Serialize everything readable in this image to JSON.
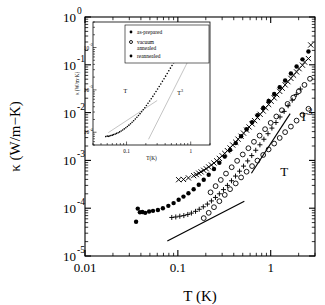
{
  "chart_data": {
    "type": "scatter",
    "title": "",
    "xlabel": "T  (K)",
    "ylabel": "κ  (W/m−K)",
    "xscale": "log",
    "yscale": "log",
    "xlim": [
      0.01,
      3.0
    ],
    "ylim": [
      1e-05,
      1.0
    ],
    "xticks": [
      0.01,
      0.1,
      1
    ],
    "xtick_labels": [
      "0.01",
      "0.1",
      "1"
    ],
    "yticks": [
      1.0,
      0.1,
      0.01,
      0.001,
      0.0001,
      1e-05
    ],
    "ytick_labels": [
      "10",
      "10",
      "10",
      "10",
      "10",
      "10"
    ],
    "ytick_exponents": [
      "0",
      "-1",
      "-2",
      "-3",
      "-4",
      "-5"
    ],
    "grid": false,
    "legend_position": "inset-top-left",
    "annotations": [
      {
        "text": "T",
        "x": 1.27,
        "y": 0.00048
      },
      {
        "text": "T",
        "sup": "3",
        "x": 2.05,
        "y": 0.0068
      }
    ],
    "guide_lines": [
      {
        "label": "T",
        "slope": 1,
        "x0": 0.077,
        "y0": 2.05e-05,
        "x1": 0.52,
        "y1": 0.00014
      },
      {
        "label": "T3",
        "slope": 3,
        "x0": 0.62,
        "y0": 0.00054,
        "x1": 1.62,
        "y1": 0.0095
      }
    ],
    "series": [
      {
        "name": "as-prepared",
        "marker": "filled-circle",
        "points": [
          [
            0.0355,
            5.2e-05
          ],
          [
            0.037,
            9.8e-05
          ],
          [
            0.039,
            8.2e-05
          ],
          [
            0.0415,
            8.3e-05
          ],
          [
            0.0445,
            8e-05
          ],
          [
            0.049,
            8.5e-05
          ],
          [
            0.054,
            8.8e-05
          ],
          [
            0.061,
            9.2e-05
          ],
          [
            0.069,
            0.0001
          ],
          [
            0.079,
            0.000112
          ],
          [
            0.09,
            0.000128
          ],
          [
            0.102,
            0.00015
          ],
          [
            0.115,
            0.000175
          ],
          [
            0.13,
            0.000205
          ],
          [
            0.148,
            0.00025
          ],
          [
            0.168,
            0.00031
          ],
          [
            0.19,
            0.000395
          ],
          [
            0.215,
            0.0005
          ],
          [
            0.245,
            0.00066
          ],
          [
            0.28,
            0.00089
          ],
          [
            0.32,
            0.0012
          ],
          [
            0.365,
            0.00165
          ],
          [
            0.42,
            0.0023
          ],
          [
            0.48,
            0.0032
          ],
          [
            0.55,
            0.0045
          ],
          [
            0.63,
            0.0063
          ],
          [
            0.72,
            0.0088
          ],
          [
            0.83,
            0.0125
          ],
          [
            0.95,
            0.0175
          ],
          [
            1.09,
            0.0245
          ],
          [
            1.25,
            0.034
          ],
          [
            1.43,
            0.047
          ],
          [
            1.65,
            0.066
          ],
          [
            1.9,
            0.092
          ],
          [
            2.2,
            0.13
          ],
          [
            2.55,
            0.19
          ]
        ]
      },
      {
        "name": "vacuum annealed",
        "marker": "open-circle",
        "points": [
          [
            0.19,
            6.2e-05
          ],
          [
            0.215,
            8e-05
          ],
          [
            0.245,
            0.000105
          ],
          [
            0.28,
            0.00014
          ],
          [
            0.32,
            0.00019
          ],
          [
            0.365,
            0.00025
          ],
          [
            0.42,
            0.00033
          ],
          [
            0.48,
            0.00044
          ],
          [
            0.55,
            0.00058
          ],
          [
            0.63,
            0.00076
          ],
          [
            0.72,
            0.00099
          ],
          [
            0.83,
            0.0013
          ],
          [
            0.95,
            0.0017
          ],
          [
            1.09,
            0.00225
          ],
          [
            1.25,
            0.00295
          ],
          [
            1.43,
            0.0039
          ],
          [
            1.65,
            0.0051
          ],
          [
            1.9,
            0.0068
          ],
          [
            2.2,
            0.009
          ],
          [
            2.55,
            0.012
          ],
          [
            0.225,
            0.000215
          ],
          [
            0.255,
            0.00029
          ],
          [
            0.29,
            0.00039
          ],
          [
            0.33,
            0.00053
          ],
          [
            0.38,
            0.00072
          ],
          [
            0.435,
            0.00098
          ],
          [
            0.5,
            0.00133
          ],
          [
            0.575,
            0.0018
          ],
          [
            0.66,
            0.00245
          ],
          [
            0.76,
            0.0033
          ],
          [
            0.87,
            0.0045
          ],
          [
            1.0,
            0.0061
          ],
          [
            1.15,
            0.0083
          ],
          [
            1.32,
            0.0112
          ],
          [
            1.52,
            0.0152
          ],
          [
            1.75,
            0.0206
          ],
          [
            2.01,
            0.028
          ],
          [
            2.31,
            0.038
          ],
          [
            2.65,
            0.051
          ]
        ]
      },
      {
        "name": "reannealed",
        "marker": "cross",
        "points": [
          [
            0.13,
            0.00043
          ],
          [
            0.148,
            0.00048
          ],
          [
            0.168,
            0.00054
          ],
          [
            0.19,
            0.00062
          ],
          [
            0.215,
            0.00073
          ],
          [
            0.245,
            0.00088
          ],
          [
            0.28,
            0.0011
          ],
          [
            0.32,
            0.0014
          ],
          [
            0.365,
            0.00182
          ],
          [
            0.42,
            0.0024
          ],
          [
            0.48,
            0.0032
          ],
          [
            0.55,
            0.0043
          ],
          [
            0.63,
            0.0058
          ],
          [
            0.72,
            0.0079
          ],
          [
            0.83,
            0.0108
          ],
          [
            0.95,
            0.0148
          ],
          [
            1.09,
            0.0203
          ],
          [
            1.25,
            0.0278
          ],
          [
            1.43,
            0.038
          ],
          [
            1.65,
            0.052
          ],
          [
            1.9,
            0.071
          ],
          [
            2.2,
            0.098
          ],
          [
            2.55,
            0.135
          ],
          [
            2.7,
            0.26
          ],
          [
            0.115,
            0.0004
          ],
          [
            0.102,
            0.000395
          ],
          [
            0.158,
            0.000505
          ],
          [
            0.178,
            0.000575
          ],
          [
            0.202,
            0.00067
          ],
          [
            0.23,
            0.0008
          ],
          [
            0.262,
            0.00098
          ],
          [
            0.3,
            0.00125
          ],
          [
            0.342,
            0.0016
          ],
          [
            0.39,
            0.0021
          ],
          [
            0.445,
            0.00278
          ],
          [
            0.51,
            0.00372
          ],
          [
            0.585,
            0.005
          ],
          [
            0.67,
            0.0068
          ],
          [
            0.77,
            0.0092
          ],
          [
            0.88,
            0.0126
          ],
          [
            1.01,
            0.0173
          ],
          [
            1.16,
            0.0237
          ],
          [
            1.33,
            0.0324
          ],
          [
            1.53,
            0.0444
          ],
          [
            1.76,
            0.0607
          ],
          [
            2.02,
            0.083
          ],
          [
            2.32,
            0.114
          ]
        ]
      },
      {
        "name": "fourth-set",
        "marker": "plus",
        "points": [
          [
            0.086,
            6.4e-05
          ],
          [
            0.095,
            6.55e-05
          ],
          [
            0.105,
            6.8e-05
          ],
          [
            0.116,
            7e-05
          ],
          [
            0.128,
            7.4e-05
          ],
          [
            0.14,
            7.9e-05
          ],
          [
            0.155,
            8.6e-05
          ],
          [
            0.17,
            9.5e-05
          ],
          [
            0.188,
            0.000107
          ],
          [
            0.208,
            0.000122
          ],
          [
            0.23,
            0.000142
          ],
          [
            0.254,
            0.000168
          ],
          [
            0.28,
            0.0002
          ],
          [
            0.31,
            0.000245
          ],
          [
            0.342,
            0.0003
          ],
          [
            0.378,
            0.000375
          ],
          [
            0.418,
            0.00047
          ],
          [
            0.462,
            0.000595
          ],
          [
            0.51,
            0.00076
          ],
          [
            0.565,
            0.000975
          ],
          [
            0.625,
            0.00126
          ],
          [
            0.69,
            0.00163
          ],
          [
            0.765,
            0.00212
          ],
          [
            0.845,
            0.00277
          ],
          [
            0.935,
            0.00362
          ],
          [
            1.03,
            0.00474
          ],
          [
            1.14,
            0.0062
          ],
          [
            1.26,
            0.0081
          ],
          [
            1.395,
            0.0106
          ],
          [
            1.54,
            0.0139
          ],
          [
            1.705,
            0.0182
          ],
          [
            1.885,
            0.0238
          ],
          [
            2.085,
            0.0311
          ]
        ]
      }
    ]
  },
  "inset": {
    "xlabel": "T(K)",
    "ylabel": "κ (W/m·K)",
    "xtick_labels": [
      "0.1",
      "1"
    ],
    "ytick_labels": [
      "10",
      "10",
      "10"
    ],
    "ytick_exponents": [
      "-2",
      "-3",
      "-4"
    ],
    "xlim": [
      0.03,
      2.0
    ],
    "ylim": [
      5e-05,
      0.04
    ],
    "annotations": [
      {
        "text": "T",
        "sup": "",
        "x": 0.09,
        "y": 0.00085
      },
      {
        "text": "T",
        "sup": "3",
        "x": 0.62,
        "y": 0.00075
      }
    ],
    "legend": [
      {
        "label": "as-prepared",
        "marker": "filled-circle"
      },
      {
        "label": "vacuum annealed",
        "marker": "open-circle"
      },
      {
        "label": "reannealed",
        "marker": "filled-circle-small"
      }
    ],
    "guide_lines": [
      {
        "label": "T",
        "slope": 1,
        "x0": 0.052,
        "y0": 9.8e-05,
        "x1": 0.3,
        "y1": 0.00056
      },
      {
        "label": "T3",
        "slope": 3,
        "x0": 0.22,
        "y0": 6.8e-05,
        "x1": 0.95,
        "y1": 0.00545
      }
    ],
    "series": [
      {
        "name": "inset-curve",
        "marker": "dot",
        "points": [
          [
            0.0475,
            7.9e-05
          ],
          [
            0.05,
            8.1e-05
          ],
          [
            0.052,
            8e-05
          ],
          [
            0.0545,
            8.15e-05
          ],
          [
            0.057,
            8.4e-05
          ],
          [
            0.06,
            8.55e-05
          ],
          [
            0.063,
            8.8e-05
          ],
          [
            0.0665,
            9.05e-05
          ],
          [
            0.07,
            9.4e-05
          ],
          [
            0.074,
            9.75e-05
          ],
          [
            0.078,
            0.000102
          ],
          [
            0.0825,
            0.000107
          ],
          [
            0.087,
            0.000113
          ],
          [
            0.092,
            0.00012
          ],
          [
            0.0975,
            0.000128
          ],
          [
            0.103,
            0.000137
          ],
          [
            0.109,
            0.000147
          ],
          [
            0.1155,
            0.000159
          ],
          [
            0.122,
            0.000172
          ],
          [
            0.129,
            0.000187
          ],
          [
            0.137,
            0.000205
          ],
          [
            0.145,
            0.000225
          ],
          [
            0.1535,
            0.000248
          ],
          [
            0.1625,
            0.000275
          ],
          [
            0.172,
            0.000305
          ],
          [
            0.182,
            0.00034
          ],
          [
            0.193,
            0.00038
          ],
          [
            0.204,
            0.000428
          ],
          [
            0.216,
            0.000482
          ],
          [
            0.229,
            0.000545
          ],
          [
            0.2425,
            0.000618
          ],
          [
            0.257,
            0.000702
          ],
          [
            0.272,
            0.0008
          ],
          [
            0.288,
            0.000915
          ],
          [
            0.305,
            0.00105
          ],
          [
            0.323,
            0.0012
          ],
          [
            0.342,
            0.00138
          ],
          [
            0.3625,
            0.00159
          ],
          [
            0.384,
            0.00183
          ],
          [
            0.4065,
            0.00211
          ],
          [
            0.4305,
            0.00244
          ],
          [
            0.456,
            0.00282
          ],
          [
            0.483,
            0.00326
          ],
          [
            0.5115,
            0.00377
          ],
          [
            0.542,
            0.00437
          ],
          [
            0.574,
            0.00506
          ],
          [
            0.608,
            0.00587
          ],
          [
            0.644,
            0.00681
          ],
          [
            0.682,
            0.0079
          ],
          [
            0.722,
            0.00917
          ],
          [
            0.765,
            0.01065
          ],
          [
            0.81,
            0.01235
          ],
          [
            0.858,
            0.01435
          ],
          [
            0.909,
            0.01665
          ],
          [
            0.963,
            0.01935
          ],
          [
            1.02,
            0.02245
          ],
          [
            1.08,
            0.02605
          ],
          [
            1.144,
            0.0302
          ]
        ]
      }
    ]
  }
}
